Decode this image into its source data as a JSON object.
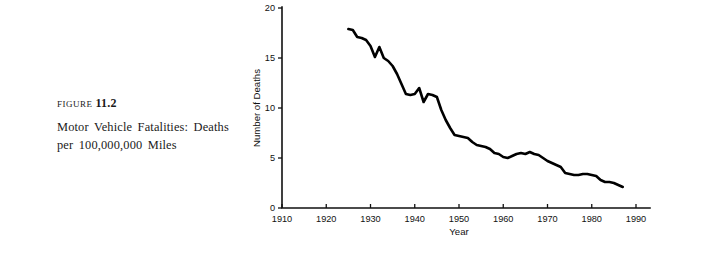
{
  "figure": {
    "label_word": "Figure",
    "number": "11.2",
    "caption": "Motor Vehicle Fatalities: Deaths per 100,000,000 Miles"
  },
  "chart_data": {
    "type": "line",
    "title": "",
    "xlabel": "Year",
    "ylabel": "Number of Deaths",
    "xlim": [
      1910,
      1990
    ],
    "ylim": [
      0,
      20
    ],
    "xticks": [
      1910,
      1920,
      1930,
      1940,
      1950,
      1960,
      1970,
      1980,
      1990
    ],
    "xtick_labels": [
      "1910",
      "1920",
      "1930",
      "1940",
      "1950",
      "1960",
      "1970",
      "1980",
      "1990"
    ],
    "yticks": [
      0,
      5,
      10,
      15,
      20
    ],
    "ytick_labels": [
      "0",
      "5",
      "10",
      "15",
      "20"
    ],
    "grid": false,
    "legend": false,
    "series": [
      {
        "name": "Deaths per 100,000,000 miles",
        "color": "#000000",
        "x": [
          1925,
          1926,
          1927,
          1928,
          1929,
          1930,
          1931,
          1932,
          1933,
          1934,
          1935,
          1936,
          1937,
          1938,
          1939,
          1940,
          1941,
          1942,
          1943,
          1944,
          1945,
          1946,
          1947,
          1948,
          1949,
          1950,
          1951,
          1952,
          1953,
          1954,
          1955,
          1956,
          1957,
          1958,
          1959,
          1960,
          1961,
          1962,
          1963,
          1964,
          1965,
          1966,
          1967,
          1968,
          1969,
          1970,
          1971,
          1972,
          1973,
          1974,
          1975,
          1976,
          1977,
          1978,
          1979,
          1980,
          1981,
          1982,
          1983,
          1984,
          1985,
          1986,
          1987
        ],
        "values": [
          17.9,
          17.8,
          17.1,
          17.0,
          16.8,
          16.2,
          15.1,
          16.1,
          15.0,
          14.7,
          14.2,
          13.4,
          12.4,
          11.4,
          11.3,
          11.4,
          12.0,
          10.6,
          11.4,
          11.3,
          11.1,
          9.8,
          8.8,
          8.0,
          7.3,
          7.2,
          7.1,
          7.0,
          6.6,
          6.3,
          6.2,
          6.1,
          5.9,
          5.5,
          5.4,
          5.1,
          5.0,
          5.2,
          5.4,
          5.5,
          5.4,
          5.6,
          5.4,
          5.3,
          5.0,
          4.7,
          4.5,
          4.3,
          4.1,
          3.5,
          3.4,
          3.3,
          3.3,
          3.4,
          3.4,
          3.3,
          3.2,
          2.8,
          2.6,
          2.6,
          2.5,
          2.3,
          2.1
        ]
      }
    ]
  }
}
